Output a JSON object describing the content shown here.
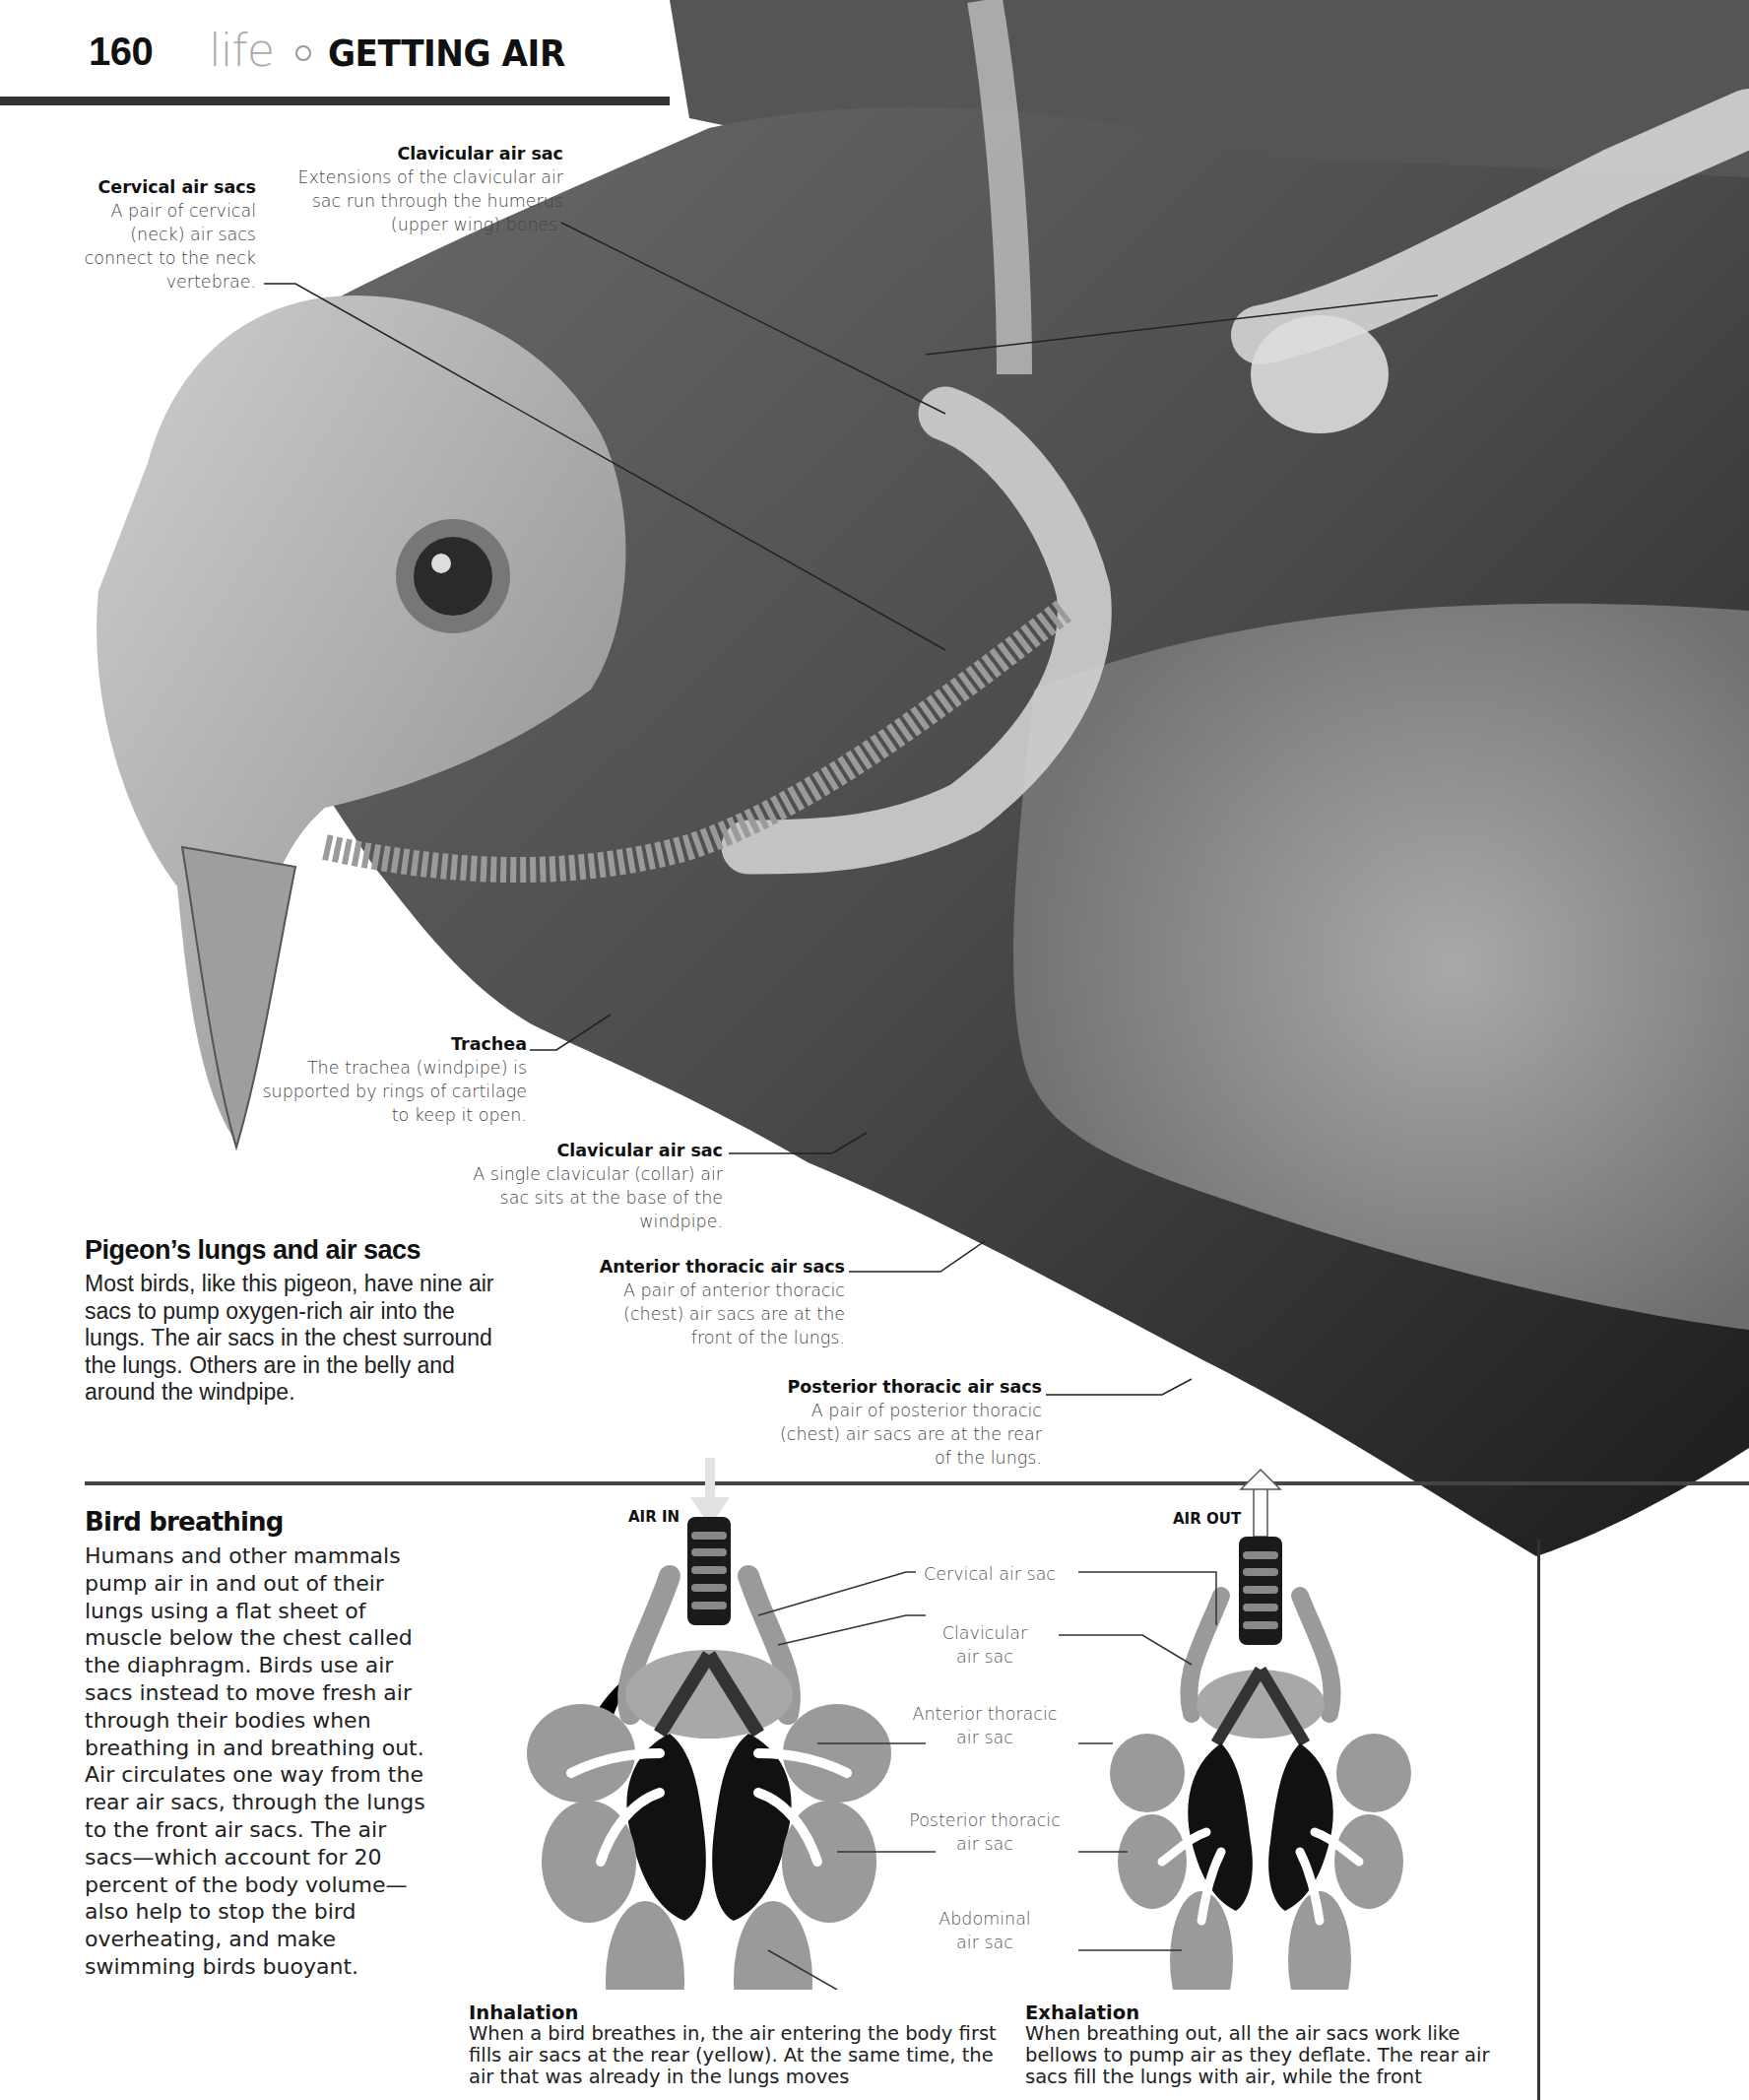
{
  "header": {
    "page_number": "160",
    "section": "life",
    "separator_icon": "circle-bullet-icon",
    "title": "GETTING AIR"
  },
  "illustration": {
    "subject": "Pigeon head, neck and chest anatomy showing air sacs",
    "callouts": [
      {
        "id": "cervical",
        "title": "Cervical air sacs",
        "text": "A pair of cervical (neck) air sacs connect to the neck vertebrae."
      },
      {
        "id": "clavicular_upper",
        "title": "Clavicular air sac",
        "text": "Extensions of the clavicular air sac run through the humerus (upper wing) bones."
      },
      {
        "id": "trachea",
        "title": "Trachea",
        "text": "The trachea (windpipe) is supported by rings of cartilage to keep it open."
      },
      {
        "id": "clavicular_lower",
        "title": "Clavicular air sac",
        "text": "A single clavicular (collar) air sac sits at the base of the windpipe."
      },
      {
        "id": "anterior_thoracic",
        "title": "Anterior thoracic air sacs",
        "text": "A pair of anterior thoracic (chest) air sacs are at the front of the lungs."
      },
      {
        "id": "posterior_thoracic",
        "title": "Posterior thoracic air sacs",
        "text": "A pair of posterior thoracic (chest) air sacs are at the rear of the lungs."
      }
    ]
  },
  "feature": {
    "heading": "Pigeon’s lungs and air sacs",
    "body": "Most birds, like this pigeon, have nine air sacs to pump oxygen-rich air into the lungs. The air sacs in the chest surround the lungs. Others are in the belly and around the windpipe."
  },
  "bird_breathing": {
    "heading": "Bird breathing",
    "body": "Humans and other mammals pump air in and out of their lungs using a flat sheet of muscle below the chest called the diaphragm. Birds use air sacs instead to move fresh air through their bodies when breathing in and breathing out. Air circulates one way from the rear air sacs, through the lungs to the front air sacs. The air sacs—which account for 20 percent of the body volume—also help to stop the bird overheating, and make swimming birds buoyant."
  },
  "diagram": {
    "air_in_label": "AIR IN",
    "air_out_label": "AIR OUT",
    "labels": {
      "cervical_1": "Cervical air sac",
      "clavicular_1": "Clavicular",
      "clavicular_2": "air sac",
      "anterior_1": "Anterior thoracic",
      "anterior_2": "air sac",
      "posterior_1": "Posterior thoracic",
      "posterior_2": "air sac",
      "abdominal_1": "Abdominal",
      "abdominal_2": "air sac"
    },
    "colors": {
      "sac": "#9a9a9a",
      "lung": "#111111",
      "arrow": "#ffffff",
      "trachea_ring": "#777777"
    }
  },
  "captions": {
    "inhalation": {
      "heading": "Inhalation",
      "body": "When a bird breathes in, the air entering the body first fills air sacs at the rear (yellow). At the same time, the air that was already in the lungs moves"
    },
    "exhalation": {
      "heading": "Exhalation",
      "body": "When breathing out, all the air sacs work like bellows to pump air as they deflate. The rear air sacs fill the lungs with air, while the front"
    }
  }
}
